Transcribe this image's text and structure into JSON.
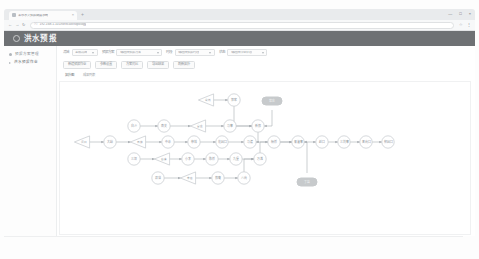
{
  "browser": {
    "tab_title": "某市水文预报调度系统",
    "tab_close": "×",
    "new_tab": "+",
    "window_minimize": "—",
    "window_maximize": "□",
    "window_close": "×",
    "nav_back": "←",
    "nav_forward": "→",
    "nav_reload": "↻",
    "lock_icon": "ⓘ",
    "url": "192.168.1.101/forecast/topology",
    "star_icon": "☆",
    "menu_icon": "⋮"
  },
  "app": {
    "title": "洪水预报",
    "logo_icon": "circle-logo"
  },
  "sidebar": {
    "items": [
      {
        "label": "预报方案管理",
        "icon": "dot-icon",
        "active": false
      },
      {
        "label": "洪水预报作业",
        "icon": "caret-icon",
        "active": true
      }
    ]
  },
  "filters": [
    {
      "label": "流域",
      "value": "全部流域",
      "width": "normal"
    },
    {
      "label": "预报方案",
      "value": "请选择预报方案",
      "width": "xwide"
    },
    {
      "label": "时段",
      "value": "请选择预报时段",
      "width": "wide"
    },
    {
      "label": "状态",
      "value": "请选择作业状态",
      "width": "wide"
    }
  ],
  "actions": [
    {
      "label": "新建预报作业"
    },
    {
      "label": "参数设置"
    },
    {
      "label": "方案对比"
    },
    {
      "label": "导出结果"
    },
    {
      "label": "刷新拓扑"
    }
  ],
  "subtabs": [
    {
      "label": "拓扑图",
      "active": true
    },
    {
      "label": "成果列表",
      "active": false
    }
  ],
  "graph": {
    "title": "流域预报拓扑结构图",
    "nodes": [
      {
        "id": "n1",
        "label": "白沙",
        "shape": "circle",
        "x": 112,
        "y": 124
      },
      {
        "id": "n2",
        "label": "南关",
        "shape": "circle",
        "x": 142,
        "y": 124
      },
      {
        "id": "n3",
        "label": "官庄",
        "shape": "triangle",
        "x": 176,
        "y": 124
      },
      {
        "id": "n4",
        "label": "马寨",
        "shape": "circle",
        "x": 208,
        "y": 124
      },
      {
        "id": "n5",
        "label": "新郑",
        "shape": "circle",
        "x": 236,
        "y": 124
      },
      {
        "id": "n6",
        "label": "尖岗",
        "shape": "triangle",
        "x": 184,
        "y": 98
      },
      {
        "id": "n7",
        "label": "郭家",
        "shape": "circle",
        "x": 212,
        "y": 98
      },
      {
        "id": "n8",
        "label": "常庄",
        "shape": "pill",
        "x": 250,
        "y": 99
      },
      {
        "id": "n9",
        "label": "丁店",
        "shape": "pill",
        "x": 285,
        "y": 180
      },
      {
        "id": "n10",
        "label": "河口",
        "shape": "triangle",
        "x": 60,
        "y": 140
      },
      {
        "id": "n11",
        "label": "大峪",
        "shape": "circle",
        "x": 88,
        "y": 140
      },
      {
        "id": "n12",
        "label": "石佛",
        "shape": "triangle",
        "x": 116,
        "y": 140
      },
      {
        "id": "n13",
        "label": "中牟",
        "shape": "circle",
        "x": 146,
        "y": 140
      },
      {
        "id": "n14",
        "label": "祭城",
        "shape": "circle",
        "x": 172,
        "y": 140
      },
      {
        "id": "n15",
        "label": "花园口",
        "shape": "circle",
        "x": 200,
        "y": 140
      },
      {
        "id": "n16",
        "label": "马渡",
        "shape": "circle",
        "x": 228,
        "y": 140
      },
      {
        "id": "n17",
        "label": "杨桥",
        "shape": "circle",
        "x": 252,
        "y": 140
      },
      {
        "id": "n18",
        "label": "来潼寨",
        "shape": "circle",
        "x": 276,
        "y": 140
      },
      {
        "id": "n19",
        "label": "赵口",
        "shape": "circle",
        "x": 300,
        "y": 140
      },
      {
        "id": "n20",
        "label": "三刘寨",
        "shape": "circle",
        "x": 322,
        "y": 140
      },
      {
        "id": "n21",
        "label": "黑岗口",
        "shape": "circle",
        "x": 344,
        "y": 140
      },
      {
        "id": "n22",
        "label": "柳园口",
        "shape": "circle",
        "x": 366,
        "y": 140
      },
      {
        "id": "n23",
        "label": "三坝",
        "shape": "circle",
        "x": 112,
        "y": 157
      },
      {
        "id": "n24",
        "label": "后寨",
        "shape": "triangle",
        "x": 140,
        "y": 157
      },
      {
        "id": "n25",
        "label": "小李",
        "shape": "circle",
        "x": 166,
        "y": 157
      },
      {
        "id": "n26",
        "label": "陈桥",
        "shape": "circle",
        "x": 190,
        "y": 157
      },
      {
        "id": "n27",
        "label": "九堡",
        "shape": "circle",
        "x": 214,
        "y": 157
      },
      {
        "id": "n28",
        "label": "万滩",
        "shape": "circle",
        "x": 238,
        "y": 157
      },
      {
        "id": "n29",
        "label": "双洎",
        "shape": "circle",
        "x": 136,
        "y": 176
      },
      {
        "id": "n30",
        "label": "辛店",
        "shape": "triangle",
        "x": 166,
        "y": 176
      },
      {
        "id": "n31",
        "label": "郑庵",
        "shape": "circle",
        "x": 196,
        "y": 176
      },
      {
        "id": "n32",
        "label": "八岗",
        "shape": "circle",
        "x": 222,
        "y": 176
      }
    ],
    "edges": [
      {
        "from": "n1",
        "to": "n2"
      },
      {
        "from": "n2",
        "to": "n3"
      },
      {
        "from": "n3",
        "to": "n4"
      },
      {
        "from": "n4",
        "to": "n5"
      },
      {
        "from": "n6",
        "to": "n7"
      },
      {
        "from": "n7",
        "to": "n5"
      },
      {
        "from": "n8",
        "to": "n5"
      },
      {
        "from": "n5",
        "to": "n16"
      },
      {
        "from": "n10",
        "to": "n11"
      },
      {
        "from": "n11",
        "to": "n12"
      },
      {
        "from": "n12",
        "to": "n13"
      },
      {
        "from": "n13",
        "to": "n14"
      },
      {
        "from": "n14",
        "to": "n15"
      },
      {
        "from": "n15",
        "to": "n16"
      },
      {
        "from": "n16",
        "to": "n17"
      },
      {
        "from": "n17",
        "to": "n18"
      },
      {
        "from": "n18",
        "to": "n19"
      },
      {
        "from": "n19",
        "to": "n20"
      },
      {
        "from": "n20",
        "to": "n21"
      },
      {
        "from": "n21",
        "to": "n22"
      },
      {
        "from": "n23",
        "to": "n24"
      },
      {
        "from": "n24",
        "to": "n25"
      },
      {
        "from": "n25",
        "to": "n26"
      },
      {
        "from": "n26",
        "to": "n27"
      },
      {
        "from": "n27",
        "to": "n28"
      },
      {
        "from": "n28",
        "to": "n18"
      },
      {
        "from": "n29",
        "to": "n30"
      },
      {
        "from": "n30",
        "to": "n31"
      },
      {
        "from": "n31",
        "to": "n32"
      },
      {
        "from": "n32",
        "to": "n28"
      },
      {
        "from": "n9",
        "to": "n18"
      }
    ]
  },
  "colors": {
    "header_bg": "#6e7174",
    "node_stroke": "#b9bec3",
    "node_fill": "#ffffff",
    "pill_fill": "#c7cacc",
    "edge": "#a9aeb3",
    "canvas_bg": "#ffffff"
  }
}
